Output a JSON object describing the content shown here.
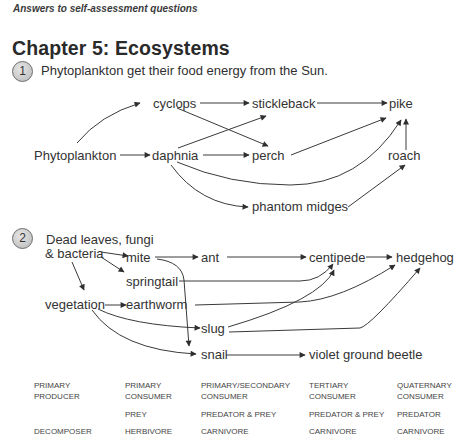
{
  "header": {
    "running_title": "Answers to self-assessment questions"
  },
  "chapter": {
    "title": "Chapter 5: Ecosystems"
  },
  "question1": {
    "number": "1",
    "text": "Phytoplankton get their food energy from the Sun.",
    "nodes": {
      "phytoplankton": "Phytoplankton",
      "cyclops": "cyclops",
      "daphnia": "daphnia",
      "stickleback": "stickleback",
      "perch": "perch",
      "pike": "pike",
      "roach": "roach",
      "phantom_midges": "phantom midges"
    },
    "edges": [
      [
        "Phytoplankton",
        "cyclops"
      ],
      [
        "Phytoplankton",
        "daphnia"
      ],
      [
        "cyclops",
        "stickleback"
      ],
      [
        "cyclops",
        "perch"
      ],
      [
        "daphnia",
        "stickleback"
      ],
      [
        "daphnia",
        "perch"
      ],
      [
        "daphnia",
        "pike"
      ],
      [
        "daphnia",
        "phantom midges"
      ],
      [
        "stickleback",
        "pike"
      ],
      [
        "perch",
        "pike"
      ],
      [
        "roach",
        "pike"
      ],
      [
        "phantom midges",
        "roach"
      ]
    ]
  },
  "question2": {
    "number": "2",
    "nodes": {
      "dead_leaves_line1": "Dead leaves, fungi",
      "dead_leaves_line2": "& bacteria",
      "vegetation": "vegetation",
      "mite": "mite",
      "springtail": "springtail",
      "earthworm": "earthworm",
      "slug": "slug",
      "snail": "snail",
      "ant": "ant",
      "centipede": "centipede",
      "hedgehog": "hedgehog",
      "violet_ground_beetle": "violet ground beetle"
    },
    "edges": [
      [
        "Dead leaves, fungi & bacteria",
        "mite"
      ],
      [
        "Dead leaves, fungi & bacteria",
        "springtail"
      ],
      [
        "Dead leaves, fungi & bacteria",
        "vegetation"
      ],
      [
        "vegetation",
        "earthworm"
      ],
      [
        "vegetation",
        "slug"
      ],
      [
        "vegetation",
        "snail"
      ],
      [
        "mite",
        "ant"
      ],
      [
        "mite",
        "snail"
      ],
      [
        "ant",
        "centipede"
      ],
      [
        "springtail",
        "centipede"
      ],
      [
        "earthworm",
        "hedgehog"
      ],
      [
        "slug",
        "centipede"
      ],
      [
        "slug",
        "hedgehog"
      ],
      [
        "centipede",
        "hedgehog"
      ],
      [
        "snail",
        "violet ground beetle"
      ]
    ]
  },
  "legend_table": {
    "columns": [
      {
        "level": "PRIMARY PRODUCER",
        "role": "",
        "diet": "DECOMPOSER"
      },
      {
        "level": "PRIMARY CONSUMER",
        "role": "PREY",
        "diet": "HERBIVORE"
      },
      {
        "level": "PRIMARY/SECONDARY CONSUMER",
        "role": "PREDATOR & PREY",
        "diet": "CARNIVORE"
      },
      {
        "level": "TERTIARY CONSUMER",
        "role": "PREDATOR & PREY",
        "diet": "CARNIVORE"
      },
      {
        "level": "QUATERNARY CONSUMER",
        "role": "PREDATOR",
        "diet": "CARNIVORE"
      }
    ],
    "cells": {
      "c0_l1": "PRIMARY",
      "c0_l2": "PRODUCER",
      "c0_role": "",
      "c0_diet": "DECOMPOSER",
      "c1_l1": "PRIMARY",
      "c1_l2": "CONSUMER",
      "c1_role": "PREY",
      "c1_diet": "HERBIVORE",
      "c2_l1": "PRIMARY/SECONDARY",
      "c2_l2": "CONSUMER",
      "c2_role": "PREDATOR & PREY",
      "c2_diet": "CARNIVORE",
      "c3_l1": "TERTIARY",
      "c3_l2": "CONSUMER",
      "c3_role": "PREDATOR & PREY",
      "c3_diet": "CARNIVORE",
      "c4_l1": "QUATERNARY",
      "c4_l2": "CONSUMER",
      "c4_role": "PREDATOR",
      "c4_diet": "CARNIVORE"
    }
  }
}
